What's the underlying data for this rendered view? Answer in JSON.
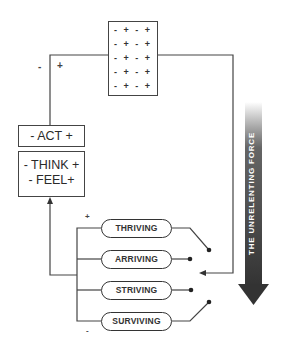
{
  "grid_box": {
    "rows": [
      "- + - +",
      "- + - +",
      "- + - +",
      "- + - +",
      "- + - +"
    ]
  },
  "loop_signs": {
    "minus": "-",
    "plus": "+"
  },
  "act_box": {
    "label": "- ACT +"
  },
  "think_feel_box": {
    "line1": "- THINK +",
    "line2": "- FEEL+"
  },
  "states": {
    "top_sign": "+",
    "bottom_sign": "-",
    "items": [
      {
        "label": "THRIVING"
      },
      {
        "label": "ARRIVING"
      },
      {
        "label": "STRIVING"
      },
      {
        "label": "SURVIVING"
      }
    ]
  },
  "force": {
    "label": "THE UNRELENTING FORCE",
    "color": "#3a3a3a"
  }
}
